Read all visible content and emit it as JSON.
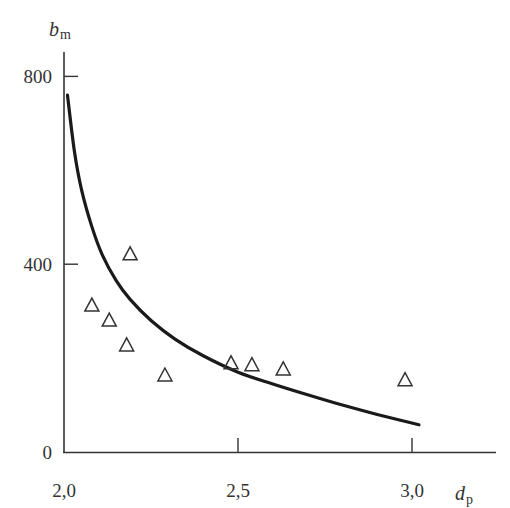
{
  "chart_data": {
    "type": "scatter",
    "title": "",
    "xlabel": "d_p",
    "ylabel": "b_m",
    "xlabel_main": "d",
    "xlabel_sub": "p",
    "ylabel_main": "b",
    "ylabel_sub": "m",
    "xlim": [
      2.0,
      3.3
    ],
    "ylim": [
      0,
      850
    ],
    "x_ticks": [
      2.0,
      2.5,
      3.0
    ],
    "x_tick_labels": [
      "2,0",
      "2,5",
      "3,0"
    ],
    "y_ticks": [
      0,
      400,
      800
    ],
    "y_tick_labels": [
      "0",
      "400",
      "800"
    ],
    "grid": false,
    "legend": null,
    "series": [
      {
        "name": "measured",
        "type": "scatter",
        "marker": "open-triangle",
        "x": [
          2.08,
          2.13,
          2.18,
          2.19,
          2.29,
          2.48,
          2.54,
          2.63,
          2.98
        ],
        "y": [
          313,
          281,
          228,
          422,
          164,
          190,
          186,
          177,
          154
        ]
      },
      {
        "name": "fit",
        "type": "line",
        "x": [
          2.01,
          2.03,
          2.05,
          2.08,
          2.11,
          2.15,
          2.19,
          2.25,
          2.32,
          2.4,
          2.5,
          2.6,
          2.7,
          2.8,
          2.9,
          3.02
        ],
        "y": [
          760,
          640,
          560,
          480,
          420,
          365,
          325,
          280,
          240,
          205,
          170,
          145,
          122,
          100,
          80,
          58
        ]
      }
    ]
  }
}
